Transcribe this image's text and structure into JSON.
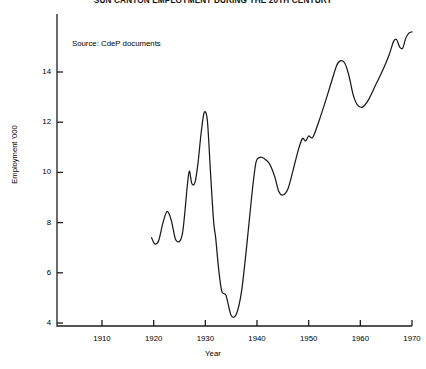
{
  "chart_data": {
    "type": "line",
    "title": "SUN CANTON EMPLOYMENT DURING THE 20TH CENTURY",
    "xlabel": "Year",
    "ylabel": "Employment '000",
    "annotation": "Source: CdeP documents",
    "grid": false,
    "legend": false,
    "xlim": [
      1903,
      1971
    ],
    "ylim": [
      4,
      15.8
    ],
    "xticks": [
      1910,
      1920,
      1930,
      1940,
      1950,
      1960,
      1970
    ],
    "xtick_labels": [
      "1910",
      "1920",
      "1930",
      "1940",
      "1950",
      "1960",
      "1970"
    ],
    "yticks": [
      4,
      6,
      8,
      10,
      12,
      14
    ],
    "ytick_labels": [
      "4",
      "6",
      "8",
      "10",
      "12",
      "14"
    ],
    "line_color": "#1a1a1a",
    "series": [
      {
        "name": "Employment",
        "x": [
          1919.6,
          1920.2,
          1921.0,
          1921.8,
          1922.6,
          1923.4,
          1924.2,
          1925.0,
          1925.6,
          1926.1,
          1926.5,
          1926.9,
          1927.4,
          1928.0,
          1928.6,
          1929.2,
          1929.8,
          1930.4,
          1931.0,
          1931.6,
          1932.0,
          1932.6,
          1933.2,
          1934.0,
          1935.0,
          1936.0,
          1937.0,
          1938.0,
          1939.0,
          1939.8,
          1940.6,
          1941.4,
          1942.4,
          1943.4,
          1944.2,
          1945.0,
          1946.0,
          1947.0,
          1948.0,
          1948.8,
          1949.4,
          1950.0,
          1950.8,
          1952.0,
          1953.2,
          1954.4,
          1955.4,
          1956.2,
          1957.0,
          1957.8,
          1958.6,
          1959.4,
          1960.4,
          1961.6,
          1963.0,
          1964.4,
          1965.6,
          1966.4,
          1967.0,
          1967.6,
          1968.2,
          1968.8,
          1969.4,
          1970.0
        ],
        "y": [
          7.4,
          7.15,
          7.3,
          8.0,
          8.45,
          8.1,
          7.35,
          7.25,
          7.6,
          8.55,
          9.45,
          10.05,
          9.55,
          9.6,
          10.4,
          11.6,
          12.4,
          12.05,
          10.0,
          8.05,
          7.4,
          6.1,
          5.25,
          5.1,
          4.3,
          4.35,
          5.25,
          7.05,
          9.1,
          10.4,
          10.6,
          10.55,
          10.35,
          9.85,
          9.25,
          9.1,
          9.35,
          10.1,
          10.9,
          11.35,
          11.25,
          11.45,
          11.4,
          12.05,
          12.8,
          13.6,
          14.25,
          14.45,
          14.35,
          13.85,
          13.1,
          12.7,
          12.6,
          12.9,
          13.5,
          14.1,
          14.7,
          15.2,
          15.3,
          15.0,
          14.95,
          15.35,
          15.55,
          15.6
        ]
      }
    ]
  }
}
